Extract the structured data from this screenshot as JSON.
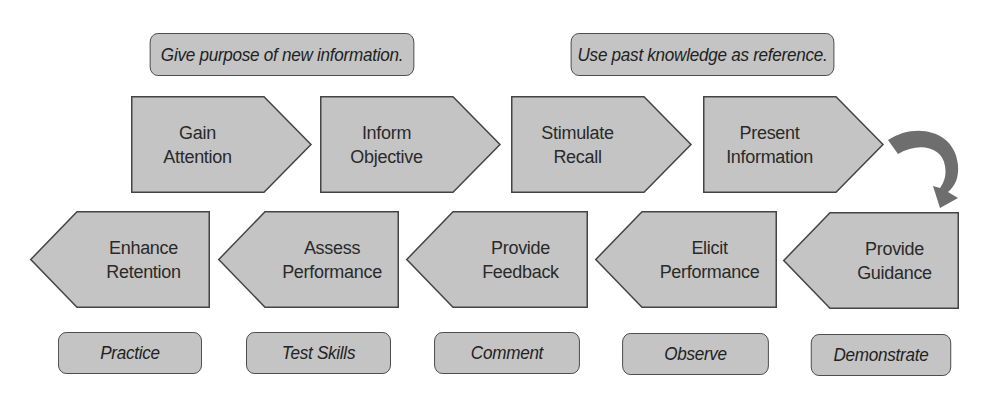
{
  "top_labels": [
    {
      "text": "Give purpose of new information."
    },
    {
      "text": "Use past knowledge as reference."
    }
  ],
  "top_row": [
    {
      "line1": "Gain",
      "line2": "Attention"
    },
    {
      "line1": "Inform",
      "line2": "Objective"
    },
    {
      "line1": "Stimulate",
      "line2": "Recall"
    },
    {
      "line1": "Present",
      "line2": "Information"
    }
  ],
  "bottom_row": [
    {
      "line1": "Enhance",
      "line2": "Retention"
    },
    {
      "line1": "Assess",
      "line2": "Performance"
    },
    {
      "line1": "Provide",
      "line2": "Feedback"
    },
    {
      "line1": "Elicit",
      "line2": "Performance"
    },
    {
      "line1": "Provide",
      "line2": "Guidance"
    }
  ],
  "bottom_labels": [
    {
      "text": "Practice"
    },
    {
      "text": "Test Skills"
    },
    {
      "text": "Comment"
    },
    {
      "text": "Observe"
    },
    {
      "text": "Demonstrate"
    }
  ],
  "colors": {
    "fill": "#c4c4c4",
    "stroke": "#444444",
    "arrow": "#6e6e6e"
  }
}
